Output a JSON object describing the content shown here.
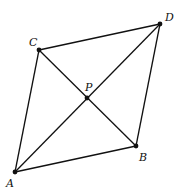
{
  "diagram": {
    "type": "parallelogram-with-diagonals",
    "line_color": "#111111",
    "points": {
      "A": {
        "label": "A",
        "x": 15,
        "y": 172,
        "lx": 6,
        "ly": 187
      },
      "B": {
        "label": "B",
        "x": 136,
        "y": 146,
        "lx": 139,
        "ly": 161
      },
      "C": {
        "label": "C",
        "x": 39,
        "y": 50,
        "lx": 29,
        "ly": 46
      },
      "D": {
        "label": "D",
        "x": 160,
        "y": 24,
        "lx": 165,
        "ly": 21
      },
      "P": {
        "label": "P",
        "x": 87,
        "y": 98,
        "lx": 85,
        "ly": 91
      }
    },
    "segments": [
      [
        "A",
        "C"
      ],
      [
        "C",
        "D"
      ],
      [
        "D",
        "B"
      ],
      [
        "B",
        "A"
      ],
      [
        "A",
        "D"
      ],
      [
        "C",
        "B"
      ]
    ]
  }
}
